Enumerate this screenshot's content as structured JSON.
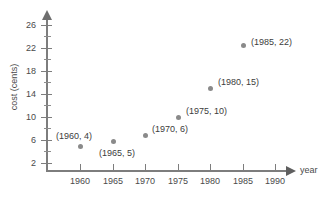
{
  "chart_data": {
    "type": "scatter",
    "title": "",
    "xlabel": "year",
    "ylabel": "cost (cents)",
    "xlim": [
      1956,
      1993
    ],
    "ylim": [
      0,
      27
    ],
    "grid": false,
    "legend": "none",
    "x": [
      1960,
      1965,
      1970,
      1975,
      1980,
      1985
    ],
    "values": [
      4,
      5,
      6,
      10,
      15,
      22
    ],
    "points": [
      {
        "x": 1960,
        "y": 4,
        "label": "(1960, 4)",
        "px": 80,
        "py": 146,
        "lx": 56,
        "ly": 131
      },
      {
        "x": 1965,
        "y": 5,
        "label": "(1965, 5)",
        "px": 113,
        "py": 141,
        "lx": 99,
        "ly": 148
      },
      {
        "x": 1970,
        "y": 6,
        "label": "(1970, 6)",
        "px": 145,
        "py": 135,
        "lx": 152,
        "ly": 124
      },
      {
        "x": 1975,
        "y": 10,
        "label": "(1975, 10)",
        "px": 178,
        "py": 117,
        "lx": 186,
        "ly": 106
      },
      {
        "x": 1980,
        "y": 15,
        "label": "(1980, 15)",
        "px": 210,
        "py": 88,
        "lx": 218,
        "ly": 77
      },
      {
        "x": 1985,
        "y": 22,
        "label": "(1985, 22)",
        "px": 243,
        "py": 45,
        "lx": 251,
        "ly": 37
      }
    ],
    "xticks": [
      {
        "label": "1960",
        "px": 80
      },
      {
        "label": "1965",
        "px": 113
      },
      {
        "label": "1970",
        "px": 145
      },
      {
        "label": "1975",
        "px": 178
      },
      {
        "label": "1980",
        "px": 210
      },
      {
        "label": "1985",
        "px": 243
      },
      {
        "label": "1990",
        "px": 275
      }
    ],
    "yticks": [
      {
        "label": "26",
        "py": 25
      },
      {
        "label": "22",
        "py": 48
      },
      {
        "label": "18",
        "py": 71
      },
      {
        "label": "14",
        "py": 94
      },
      {
        "label": "10",
        "py": 117
      },
      {
        "label": "6",
        "py": 140
      },
      {
        "label": "2",
        "py": 163
      }
    ],
    "yticks_minor": [
      36,
      59,
      82,
      105,
      128,
      151
    ],
    "colors": {
      "marker": "#8a8a8a",
      "axis": "#7d7d7d",
      "text": "#3c3c3c"
    }
  }
}
